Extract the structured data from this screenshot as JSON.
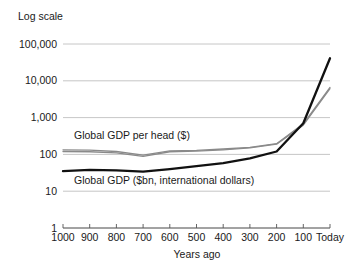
{
  "chart_data": {
    "type": "line",
    "title": "",
    "note": "Log scale",
    "xlabel": "Years ago",
    "ylabel": "",
    "grid": true,
    "legend_position": "inline-annotation",
    "x": [
      1000,
      900,
      800,
      700,
      600,
      500,
      400,
      300,
      200,
      100,
      0
    ],
    "categories": [
      "1000",
      "900",
      "800",
      "700",
      "600",
      "500",
      "400",
      "300",
      "200",
      "100",
      "Today"
    ],
    "ytick_labels": [
      "1",
      "10",
      "100",
      "1,000",
      "10,000",
      "100,000"
    ],
    "ytick_values": [
      1,
      10,
      100,
      1000,
      10000,
      100000
    ],
    "ylim": [
      1,
      100000
    ],
    "series": [
      {
        "name": "Global GDP ($bn, international dollars)",
        "color": "#111111",
        "style": "thick",
        "values": [
          35,
          38,
          37,
          34,
          40,
          48,
          58,
          78,
          120,
          700,
          41000
        ]
      },
      {
        "name": "Global GDP per head ($)",
        "color": "#8a8a8a",
        "style": "thin",
        "values": [
          133,
          130,
          120,
          95,
          125,
          128,
          140,
          155,
          195,
          680,
          6600
        ]
      },
      {
        "name": "Global GDP per head ($) alt",
        "color": "#8a8a8a",
        "style": "thin",
        "values": [
          120,
          118,
          110,
          88,
          118,
          122,
          133,
          150,
          190,
          620,
          6100
        ]
      }
    ],
    "annotations": [
      {
        "text": "Global GDP per head ($)",
        "x_px": 74,
        "y_px": 139
      },
      {
        "text": "Global GDP ($bn, international dollars)",
        "x_px": 74,
        "y_px": 184
      }
    ]
  }
}
